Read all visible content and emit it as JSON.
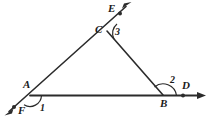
{
  "figure": {
    "background_color": "#ffffff",
    "stroke_color": "#2b2b2b",
    "label_color": "#1a1a1a",
    "points": {
      "A": {
        "label": "A",
        "x": 30,
        "y": 95
      },
      "B": {
        "label": "B",
        "x": 163,
        "y": 95
      },
      "C": {
        "label": "C",
        "x": 107,
        "y": 30
      },
      "D": {
        "label": "D",
        "x": 183,
        "y": 95
      },
      "E": {
        "label": "E",
        "x": 120,
        "y": 13
      },
      "F": {
        "label": "F",
        "x": 14,
        "y": 107
      }
    },
    "angle_labels": [
      {
        "label": "1",
        "vertex": "A",
        "x": 43,
        "y": 105
      },
      {
        "label": "2",
        "vertex": "B",
        "x": 173,
        "y": 79
      },
      {
        "label": "3",
        "vertex": "C",
        "x": 116,
        "y": 32
      }
    ],
    "segments": [
      {
        "name": "side-AC",
        "from": "A",
        "to": "C"
      },
      {
        "name": "side-CB",
        "from": "C",
        "to": "B"
      },
      {
        "name": "side-AB",
        "from": "A",
        "to": "B"
      }
    ],
    "rays": [
      {
        "name": "ray-AF",
        "from": "A",
        "through": "F",
        "arrow": true
      },
      {
        "name": "ray-BD",
        "from": "B",
        "through": "D",
        "arrow": true
      },
      {
        "name": "ray-CE",
        "from": "C",
        "through": "E",
        "arrow": true
      }
    ],
    "marked_dots": [
      "E",
      "D",
      "F"
    ]
  }
}
